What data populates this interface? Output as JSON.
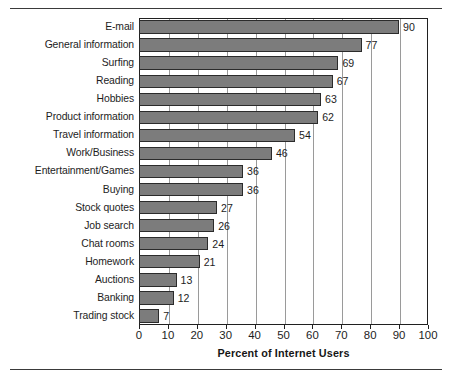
{
  "figure": {
    "top_rule": "horizontal-rule",
    "bottom_rule": "horizontal-rule"
  },
  "chart_data": {
    "type": "bar",
    "orientation": "horizontal",
    "title": "",
    "xlabel": "Percent of Internet Users",
    "ylabel": "",
    "xlim": [
      0,
      100
    ],
    "xticks": [
      "0",
      "10",
      "20",
      "30",
      "40",
      "50",
      "60",
      "70",
      "80",
      "90",
      "100"
    ],
    "grid": "vertical",
    "legend": "none",
    "bar_color": "#7c7c7c",
    "bar_edge_color": "#2b2b2b",
    "frame_color": "#202020",
    "gridline_color": "#9a9a9a",
    "categories": [
      "E-mail",
      "General information",
      "Surfing",
      "Reading",
      "Hobbies",
      "Product information",
      "Travel information",
      "Work/Business",
      "Entertainment/Games",
      "Buying",
      "Stock quotes",
      "Job search",
      "Chat rooms",
      "Homework",
      "Auctions",
      "Banking",
      "Trading stock"
    ],
    "values": [
      90,
      77,
      69,
      67,
      63,
      62,
      54,
      46,
      36,
      36,
      27,
      26,
      24,
      21,
      13,
      12,
      7
    ],
    "value_labels": [
      "90",
      "77",
      "69",
      "67",
      "63",
      "62",
      "54",
      "46",
      "36",
      "36",
      "27",
      "26",
      "24",
      "21",
      "13",
      "12",
      "7"
    ]
  }
}
